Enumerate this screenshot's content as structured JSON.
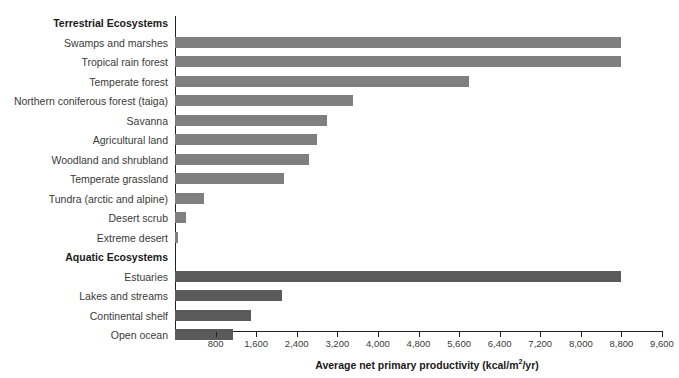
{
  "chart_data": {
    "type": "bar",
    "orientation": "horizontal",
    "title": "",
    "xlabel": "Average net primary productivity (kcal/m2/yr)",
    "xlabel_parts": {
      "before": "Average net primary productivity (kcal/m",
      "sup": "2",
      "after": "/yr)"
    },
    "ylabel": "",
    "xlim": [
      0,
      9600
    ],
    "xticks": [
      800,
      1600,
      2400,
      3200,
      4000,
      4800,
      5600,
      6400,
      7200,
      8000,
      8800,
      9600
    ],
    "xtick_labels": [
      "800",
      "1,600",
      "2,400",
      "3,200",
      "4,000",
      "4,800",
      "5,600",
      "6,400",
      "7,200",
      "8,000",
      "8,800",
      "9,600"
    ],
    "grid": false,
    "legend": false,
    "groups": [
      {
        "name": "Terrestrial Ecosystems",
        "color": "#7f7f7f",
        "categories": [
          "Swamps and marshes",
          "Tropical rain forest",
          "Temperate forest",
          "Northern coniferous forest (taiga)",
          "Savanna",
          "Agricultural land",
          "Woodland and shrubland",
          "Temperate grassland",
          "Tundra (arctic and alpine)",
          "Desert scrub",
          "Extreme desert"
        ],
        "values": [
          8800,
          8800,
          5800,
          3500,
          3000,
          2800,
          2650,
          2150,
          570,
          220,
          60
        ]
      },
      {
        "name": "Aquatic Ecosystems",
        "color": "#5a5a5a",
        "categories": [
          "Estuaries",
          "Lakes and streams",
          "Continental shelf",
          "Open ocean"
        ],
        "values": [
          8800,
          2100,
          1500,
          1150
        ]
      }
    ]
  },
  "colors": {
    "terrestrial_bar": "#7f7f7f",
    "aquatic_bar": "#5a5a5a",
    "axis": "#231f20",
    "label_text": "#3a3a3a",
    "background": "#ffffff"
  }
}
